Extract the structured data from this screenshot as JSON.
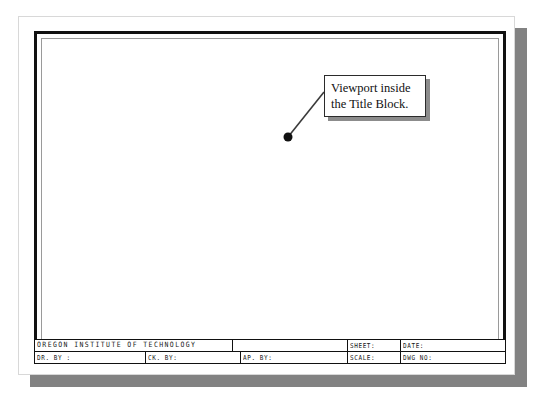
{
  "document": {
    "kind": "cad-drawing-sheet",
    "background_color": "#ffffff",
    "paper_color": "#ffffff",
    "shadow_color": "#828282",
    "border_color": "#111111"
  },
  "callout": {
    "text": "Viewport inside\nthe Title Block.",
    "border_color": "#2b2b2b",
    "shadow_color": "#8c8c8c",
    "leader": {
      "from_x": 324,
      "from_y": 92,
      "to_x": 288,
      "to_y": 137,
      "dot_radius": 4.5,
      "dot_color": "#111111",
      "line_color": "#3a3a3a"
    }
  },
  "title_block": {
    "top_row": {
      "organization": "OREGON INSTITUTE OF TECHNOLOGY",
      "blank": "",
      "sheet": "SHEET:",
      "date": "DATE:"
    },
    "bottom_row": {
      "drawn_by": "DR. BY :",
      "checked_by": "CK. BY:",
      "approved_by": "AP. BY:",
      "scale": "SCALE:",
      "drawing_number": "DWG NO:"
    }
  }
}
